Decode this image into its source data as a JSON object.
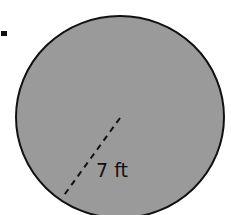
{
  "figure": {
    "shape": "circle",
    "fill_color": "#9a9a9a",
    "stroke_color": "#111111",
    "radius_label": "7 ft",
    "bullet_marker": "■"
  }
}
